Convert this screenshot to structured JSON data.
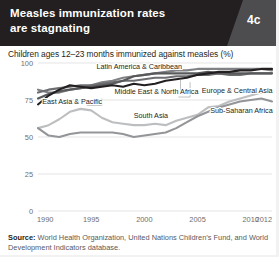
{
  "header": {
    "title_line1": "Measles immunization rates",
    "title_line2": "are stagnating",
    "badge": "4c",
    "background_color": "#231f20",
    "badge_color": "#4d4d4f"
  },
  "subtitle": "Children ages 12–23 months immunized against measles (%)",
  "source": {
    "label": "Source:",
    "text": " World Health Organization, United Nations Children’s Fund, and World Development Indicators database."
  },
  "chart_data": {
    "type": "line",
    "title": "Measles immunization rates are stagnating",
    "subtitle": "Children ages 12–23 months immunized against measles (%)",
    "xlabel": "",
    "ylabel": "",
    "xlim": [
      1990,
      2012
    ],
    "ylim": [
      0,
      100
    ],
    "yticks": [
      0,
      25,
      50,
      75,
      100
    ],
    "ytick_labels": [
      "0",
      "25",
      "50",
      "75",
      "100"
    ],
    "xticks": [
      1990,
      1995,
      2000,
      2005,
      2010,
      2012
    ],
    "xtick_labels": [
      "1990",
      "1995",
      "2000",
      "2005",
      "2010",
      "2012"
    ],
    "grid": "horizontal",
    "legend": "inline-annotations",
    "x": [
      1990,
      1991,
      1992,
      1993,
      1994,
      1995,
      1996,
      1997,
      1998,
      1999,
      2000,
      2001,
      2002,
      2003,
      2004,
      2005,
      2006,
      2007,
      2008,
      2009,
      2010,
      2011,
      2012
    ],
    "series": [
      {
        "name": "Latin America & Caribbean",
        "color": "#58595b",
        "label_x": 1995.5,
        "label_y": 96,
        "values": [
          76,
          79,
          81,
          82,
          83,
          84,
          85,
          86,
          88,
          91,
          92,
          93,
          93,
          93,
          93,
          93,
          94,
          93,
          93,
          93,
          93,
          93,
          93
        ]
      },
      {
        "name": "Europe & Central Asia",
        "color": "#808285",
        "label_x": 2005.4,
        "label_y": 80,
        "values": [
          82,
          80,
          80,
          82,
          83,
          85,
          87,
          88,
          90,
          91,
          92,
          93,
          94,
          95,
          95,
          96,
          96,
          96,
          96,
          96,
          96,
          96,
          95
        ]
      },
      {
        "name": "East Asia & Pacific",
        "color": "#231f20",
        "label_x": 1990.4,
        "label_y": 72,
        "values": [
          72,
          78,
          82,
          85,
          84,
          83,
          84,
          85,
          84,
          86,
          85,
          86,
          88,
          89,
          90,
          92,
          93,
          94,
          94,
          95,
          95,
          96,
          96
        ]
      },
      {
        "name": "Middle East & North Africa",
        "color": "#6d6e71",
        "label_x": 1997.2,
        "label_y": 79,
        "values": [
          80,
          82,
          83,
          84,
          85,
          85,
          86,
          87,
          88,
          88,
          89,
          90,
          90,
          91,
          91,
          92,
          92,
          93,
          92,
          92,
          93,
          93,
          93
        ]
      },
      {
        "name": "South Asia",
        "color": "#bcbec0",
        "label_x": 1999.0,
        "label_y": 63,
        "values": [
          56,
          58,
          62,
          67,
          69,
          68,
          63,
          60,
          59,
          58,
          58,
          59,
          58,
          61,
          63,
          65,
          70,
          71,
          74,
          76,
          78,
          80,
          80
        ]
      },
      {
        "name": "Sub-Saharan Africa",
        "color": "#939598",
        "label_x": 2006.2,
        "label_y": 66,
        "values": [
          56,
          51,
          50,
          52,
          53,
          53,
          53,
          53,
          52,
          50,
          51,
          52,
          53,
          56,
          60,
          64,
          67,
          70,
          72,
          74,
          75,
          76,
          74
        ]
      }
    ],
    "annotations": [
      "Latin America & Caribbean",
      "Europe & Central Asia",
      "East Asia & Pacific",
      "Middle East & North Africa",
      "South Asia",
      "Sub-Saharan Africa"
    ]
  }
}
